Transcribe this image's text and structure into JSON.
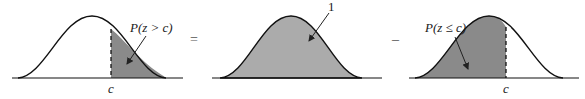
{
  "colors": {
    "curve": "#111111",
    "shade": "#a9a9a9",
    "shade_dark": "#7d7d7d",
    "background": "#ffffff"
  },
  "panels": [
    {
      "id": "right-tail",
      "label": "P(z > c)",
      "axis_label": "c",
      "shaded": "right of c"
    },
    {
      "id": "total",
      "label": "1",
      "axis_label": "",
      "shaded": "entire area"
    },
    {
      "id": "left-cumulative",
      "label": "P(z ≤ c)",
      "axis_label": "c",
      "shaded": "left of c"
    }
  ],
  "operators": {
    "equals": "=",
    "minus": "–"
  }
}
